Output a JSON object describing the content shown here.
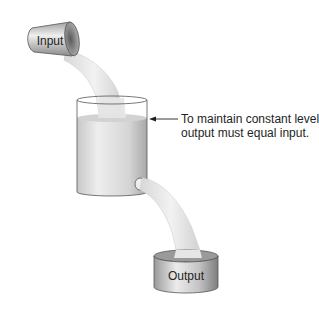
{
  "diagram": {
    "input_label": "Input",
    "output_label": "Output",
    "annotation": {
      "line1": "To maintain constant level,",
      "line2": "output must equal input."
    },
    "colors": {
      "metal_light": "#e8e8e8",
      "metal_mid": "#b9b9b9",
      "metal_dark": "#7a7a7a",
      "water": "#dcdcdc",
      "water_highlight": "#f4f4f4",
      "outline": "#4a4a4a",
      "text": "#1e1e1e"
    }
  }
}
